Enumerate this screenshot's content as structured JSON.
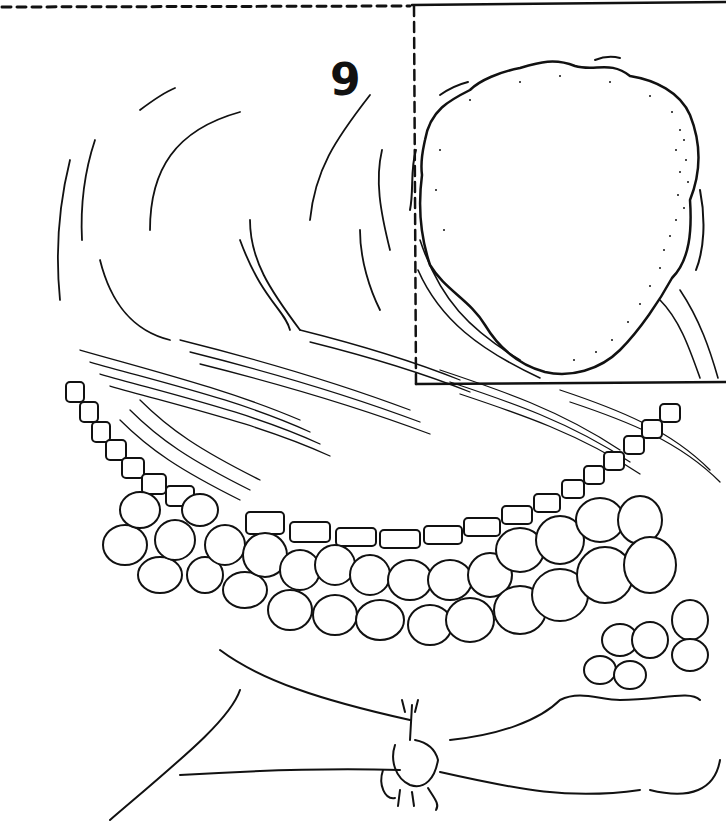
{
  "figure": {
    "label": "9",
    "type": "scientific line illustration",
    "colors": {
      "ink": "#111111",
      "paper": "#ffffff"
    },
    "inset": {
      "left_edge": "dashed",
      "bottom_edge": "solid",
      "content": "stippled rounded body"
    },
    "regions": [
      "upper curved tissue with fine strokes",
      "hatched transition band",
      "row of rectangular cells",
      "multi-row rounded cell layer",
      "lower stippled base with small appendage"
    ]
  }
}
